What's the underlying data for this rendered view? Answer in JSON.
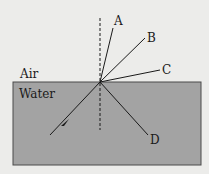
{
  "media": {
    "top_label": "Air",
    "bottom_label": "Water"
  },
  "rays": {
    "A": "A",
    "B": "B",
    "C": "C",
    "D": "D"
  },
  "colors": {
    "background": "#ececea",
    "water_fill": "#a3a3a3",
    "line": "#1a1a1a"
  }
}
